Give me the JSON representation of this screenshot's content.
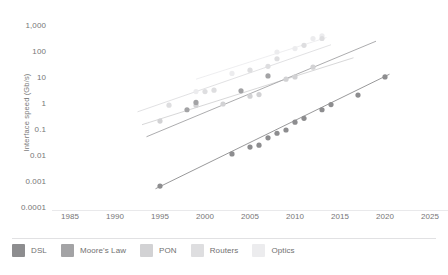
{
  "chart_data": {
    "type": "scatter",
    "title": "",
    "xlabel": "",
    "ylabel": "Interface speed (Gb/s)",
    "yscale": "log",
    "xlim": [
      1983,
      2026
    ],
    "ylim": [
      0.0001,
      1000
    ],
    "xticks": [
      "1985",
      "1990",
      "1995",
      "2000",
      "2005",
      "2010",
      "2015",
      "2020",
      "2025"
    ],
    "xtick_values": [
      1985,
      1990,
      1995,
      2000,
      2005,
      2010,
      2015,
      2020,
      2025
    ],
    "yticks": [
      "1,000",
      "100",
      "10",
      "1",
      "0.1",
      "0.01",
      "0.001",
      "0.0001"
    ],
    "ytick_values": [
      1000,
      100,
      10,
      1,
      0.1,
      0.01,
      0.001,
      0.0001
    ],
    "grid": false,
    "legend_position": "bottom",
    "series": [
      {
        "name": "DSL",
        "color": "#8d8d8f",
        "trend": {
          "x": [
            1994.5,
            2020.5
          ],
          "y": [
            0.00055,
            14
          ]
        },
        "points": [
          {
            "x": 1995,
            "y": 0.0007
          },
          {
            "x": 2003,
            "y": 0.012
          },
          {
            "x": 2005,
            "y": 0.022
          },
          {
            "x": 2006,
            "y": 0.026
          },
          {
            "x": 2007,
            "y": 0.05
          },
          {
            "x": 2008,
            "y": 0.075
          },
          {
            "x": 2009,
            "y": 0.1
          },
          {
            "x": 2010,
            "y": 0.2
          },
          {
            "x": 2011,
            "y": 0.28
          },
          {
            "x": 2013,
            "y": 0.6
          },
          {
            "x": 2014,
            "y": 0.95
          },
          {
            "x": 2017,
            "y": 2.2
          },
          {
            "x": 2020,
            "y": 11
          }
        ]
      },
      {
        "name": "Moore's Law",
        "color": "#a3a3a5",
        "trend": {
          "x": [
            1993.5,
            2019.0
          ],
          "y": [
            0.055,
            260
          ]
        },
        "points": [
          {
            "x": 1998,
            "y": 0.6
          },
          {
            "x": 1999,
            "y": 1.15
          },
          {
            "x": 2004,
            "y": 3.2
          },
          {
            "x": 2007,
            "y": 12
          }
        ]
      },
      {
        "name": "PON",
        "color": "#d2d2d4",
        "trend": {
          "x": [
            1993.0,
            2016.5
          ],
          "y": [
            0.16,
            60
          ]
        },
        "points": [
          {
            "x": 1995,
            "y": 0.22
          },
          {
            "x": 1999,
            "y": 0.9
          },
          {
            "x": 2002,
            "y": 1.0
          },
          {
            "x": 2005,
            "y": 2.0
          },
          {
            "x": 2006,
            "y": 2.3
          },
          {
            "x": 2009,
            "y": 9
          },
          {
            "x": 2010,
            "y": 11
          },
          {
            "x": 2012,
            "y": 26
          }
        ]
      },
      {
        "name": "Routers",
        "color": "#dedee0",
        "trend": {
          "x": [
            1992.5,
            2014.0
          ],
          "y": [
            0.5,
            190
          ]
        },
        "points": [
          {
            "x": 1996,
            "y": 0.9
          },
          {
            "x": 2000,
            "y": 3.0
          },
          {
            "x": 2001,
            "y": 3.4
          },
          {
            "x": 2005,
            "y": 20
          },
          {
            "x": 2007,
            "y": 28
          },
          {
            "x": 2008,
            "y": 55
          },
          {
            "x": 2011,
            "y": 180
          },
          {
            "x": 2013,
            "y": 330
          }
        ]
      },
      {
        "name": "Optics",
        "color": "#ececee",
        "trend": {
          "x": [
            1999.0,
            2013.5
          ],
          "y": [
            9,
            360
          ]
        },
        "points": [
          {
            "x": 1999,
            "y": 3.0
          },
          {
            "x": 2003,
            "y": 15
          },
          {
            "x": 2008,
            "y": 100
          },
          {
            "x": 2010,
            "y": 135
          },
          {
            "x": 2012,
            "y": 330
          },
          {
            "x": 2013,
            "y": 420
          }
        ]
      }
    ]
  },
  "axis": {
    "ylabel": "Interface speed (Gb/s)"
  },
  "legend": {
    "items": [
      {
        "label": "DSL",
        "color": "#8d8d8f"
      },
      {
        "label": "Moore's Law",
        "color": "#a3a3a5"
      },
      {
        "label": "PON",
        "color": "#d2d2d4"
      },
      {
        "label": "Routers",
        "color": "#dedee0"
      },
      {
        "label": "Optics",
        "color": "#ececee"
      }
    ]
  }
}
